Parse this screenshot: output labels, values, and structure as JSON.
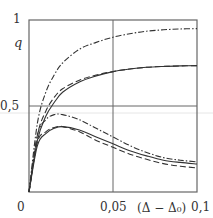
{
  "chart_data": {
    "type": "line",
    "title": "",
    "xlabel": "(Δ − Δ₀)",
    "ylabel": "q",
    "xlim": [
      0,
      0.1
    ],
    "ylim": [
      0,
      1
    ],
    "x_ticks": [
      "0",
      "0,05",
      "0,1"
    ],
    "y_ticks": [
      "0,5",
      "1"
    ],
    "grid": {
      "x": [
        0.05
      ],
      "y": [
        0.5
      ]
    },
    "x": [
      0,
      0.005,
      0.01,
      0.015,
      0.02,
      0.03,
      0.04,
      0.05,
      0.06,
      0.07,
      0.08,
      0.09,
      0.1
    ],
    "series": [
      {
        "name": "upper dash-dot",
        "style": "dashdot",
        "values": [
          0,
          0.4,
          0.58,
          0.68,
          0.75,
          0.83,
          0.87,
          0.9,
          0.92,
          0.935,
          0.943,
          0.948,
          0.95
        ]
      },
      {
        "name": "upper dashed",
        "style": "dashed",
        "values": [
          0,
          0.33,
          0.47,
          0.55,
          0.6,
          0.65,
          0.68,
          0.7,
          0.715,
          0.725,
          0.73,
          0.733,
          0.735
        ]
      },
      {
        "name": "upper solid",
        "style": "solid",
        "values": [
          0,
          0.3,
          0.44,
          0.52,
          0.58,
          0.64,
          0.675,
          0.7,
          0.715,
          0.725,
          0.73,
          0.733,
          0.735
        ]
      },
      {
        "name": "lower dash-dot",
        "style": "dashdot",
        "values": [
          0,
          0.33,
          0.42,
          0.45,
          0.45,
          0.42,
          0.37,
          0.32,
          0.27,
          0.23,
          0.2,
          0.185,
          0.175
        ]
      },
      {
        "name": "lower solid",
        "style": "solid",
        "values": [
          0,
          0.27,
          0.34,
          0.37,
          0.38,
          0.36,
          0.32,
          0.28,
          0.24,
          0.21,
          0.185,
          0.172,
          0.163
        ]
      },
      {
        "name": "lower dashed",
        "style": "dashed",
        "values": [
          0,
          0.29,
          0.35,
          0.375,
          0.38,
          0.35,
          0.3,
          0.26,
          0.22,
          0.19,
          0.165,
          0.15,
          0.14
        ]
      }
    ]
  },
  "labels": {
    "y_axis": "q",
    "y_tick_1": "1",
    "y_tick_05": "0,5",
    "x_tick_0": "0",
    "x_tick_005": "0,05",
    "x_tick_01": "0,1",
    "x_axis": "(Δ − Δ₀)"
  }
}
